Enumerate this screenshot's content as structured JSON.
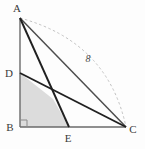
{
  "figure": {
    "background_color": "#fdfdfd",
    "stroke_color": "#2b2b2b",
    "thin_stroke_color": "#5a5a5a",
    "dashed_color": "#b9b9b9",
    "shade_fill": "#dcdcdc",
    "shade_stroke": "none"
  },
  "points": {
    "A": {
      "label": "A",
      "x": 20,
      "y": 18,
      "label_x": 17,
      "label_y": 12
    },
    "B": {
      "label": "B",
      "x": 20,
      "y": 127,
      "label_x": 10,
      "label_y": 131
    },
    "C": {
      "label": "C",
      "x": 126,
      "y": 127,
      "label_x": 131,
      "label_y": 133
    },
    "D": {
      "label": "D",
      "x": 20,
      "y": 73,
      "label_x": 8,
      "label_y": 77
    },
    "E": {
      "label": "E",
      "x": 69,
      "y": 127,
      "label_x": 65,
      "label_y": 142
    },
    "X": {
      "label": "",
      "x": 53,
      "y": 99,
      "label_x": 53,
      "label_y": 99
    }
  },
  "segments": [
    {
      "name": "side-AB",
      "from": "A",
      "to": "B",
      "style": "solid",
      "weight": "thin"
    },
    {
      "name": "side-BC",
      "from": "B",
      "to": "C",
      "style": "solid",
      "weight": "thin"
    },
    {
      "name": "side-AC",
      "from": "A",
      "to": "C",
      "style": "solid",
      "weight": "medium"
    },
    {
      "name": "cevian-AE",
      "from": "A",
      "to": "E",
      "style": "solid",
      "weight": "thick"
    },
    {
      "name": "cevian-DC",
      "from": "D",
      "to": "C",
      "style": "solid",
      "weight": "thick"
    }
  ],
  "dashed_arc": {
    "name": "measure-arc-AC",
    "from": "A",
    "to": "C",
    "control_x": 108,
    "control_y": 42,
    "label": "8",
    "label_x": 88,
    "label_y": 62
  },
  "right_angle": {
    "at": "B",
    "size": 7
  },
  "shaded_region": {
    "name": "quadrilateral-DBEX",
    "vertices": [
      "D",
      "B",
      "E",
      "X"
    ],
    "fill": "#dcdcdc"
  },
  "labels": {
    "A": "A",
    "B": "B",
    "C": "C",
    "D": "D",
    "E": "E",
    "length_AC": "8"
  }
}
